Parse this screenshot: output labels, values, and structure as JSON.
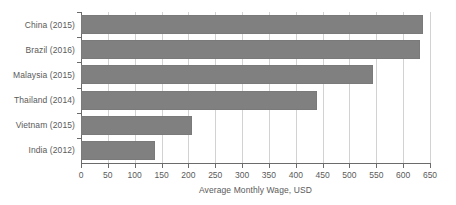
{
  "chart_data": {
    "type": "bar",
    "orientation": "horizontal",
    "title": "",
    "xlabel": "Average Monthly Wage, USD",
    "ylabel": "",
    "categories": [
      "China (2015)",
      "Brazil (2016)",
      "Malaysia (2015)",
      "Thailand (2014)",
      "Vietnam (2015)",
      "India (2012)"
    ],
    "values": [
      637,
      632,
      544,
      440,
      207,
      138
    ],
    "xlim": [
      0,
      650
    ],
    "xticks": [
      0,
      50,
      100,
      150,
      200,
      250,
      300,
      350,
      400,
      450,
      500,
      550,
      600,
      650
    ],
    "xtick_labels": [
      "0",
      "50",
      "100",
      "150",
      "200",
      "250",
      "300",
      "350",
      "400",
      "450",
      "500",
      "550",
      "600",
      "650"
    ],
    "grid": "vertical",
    "legend": null,
    "bar_color": "#808080",
    "grid_color": "#d2d2d2",
    "axis_color": "#6b6b6b",
    "text_color": "#5a5a5a",
    "background": "#ffffff"
  }
}
